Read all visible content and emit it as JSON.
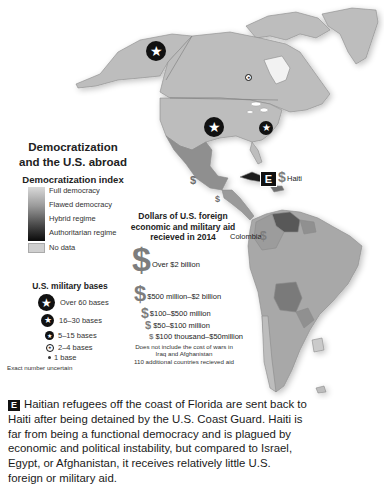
{
  "legend": {
    "title_line1": "Democratization",
    "title_line2": "and the U.S. abroad",
    "index_title": "Democratization index",
    "index_levels": [
      {
        "label": "Full democracy",
        "color": "#d4d4d4"
      },
      {
        "label": "Flawed democracy",
        "color": "#a8a8a8"
      },
      {
        "label": "Hybrid regime",
        "color": "#5e5e5e"
      },
      {
        "label": "Authoritarian regime",
        "color": "#1a1a1a"
      }
    ],
    "no_data": {
      "label": "No data",
      "color": "#cfcfcf"
    }
  },
  "bases_legend": {
    "title": "U.S. military bases",
    "items": [
      {
        "label": "Over 60 bases",
        "size": "large"
      },
      {
        "label": "16–30 bases",
        "size": "medium"
      },
      {
        "label": "5–15 bases",
        "size": "small"
      },
      {
        "label": "2–4 bases",
        "size": "tiny"
      },
      {
        "label": "1 base",
        "size": "dot"
      }
    ],
    "note": "Exact number uncertain"
  },
  "aid_legend": {
    "title_line1": "Dollars of U.S. foreign",
    "title_line2": "economic and military aid",
    "title_line3": "recieved in 2014",
    "items": [
      {
        "label": "Over $2 billion"
      },
      {
        "label": "$500 million–$2 billion"
      },
      {
        "label": "$100–$500 million"
      },
      {
        "label": "$50–$100 million"
      },
      {
        "label": "$100 thousand–$50million"
      }
    ],
    "note_line1": "Does not include the cost of wars in",
    "note_line2": "Iraq and Afghanistan",
    "note_line3": "110 additional countries recieved aid"
  },
  "map": {
    "labels": {
      "haiti": "Haiti",
      "colombia": "Colombia",
      "dollar_symbol": "$",
      "star_glyph": "★",
      "e_marker": "E"
    },
    "colors": {
      "land_default": "#b9b9b9",
      "land_border": "#8a8a8a",
      "mexico": "#8f8f8f",
      "venezuela": "#585858",
      "bolivia": "#7a7a7a",
      "uruguay": "#cacaca",
      "water": "#ffffff"
    },
    "base_markers": [
      {
        "location": "Alaska",
        "size": "large"
      },
      {
        "location": "Central United States",
        "size": "large"
      },
      {
        "location": "Eastern United States",
        "size": "medium"
      },
      {
        "location": "Canada",
        "size": "tiny"
      }
    ]
  },
  "caption": {
    "marker": "E",
    "text": "Haitian refugees off the coast of Florida are sent back to Haiti after being detained by the U.S. Coast Guard. Haiti is far from being a functional democracy and is plagued by economic and political instability, but compared to Israel, Egypt, or Afghanistan, it receives relatively little U.S. foreign or military aid."
  }
}
